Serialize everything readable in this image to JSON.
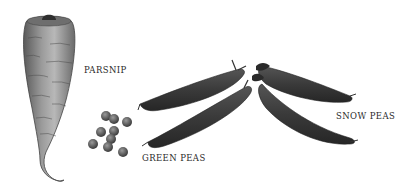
{
  "illustration": {
    "background": "#ffffff",
    "ink_color": "#3a3a3a",
    "labels": {
      "parsnip": "PARSNIP",
      "green_peas": "GREEN PEAS",
      "snow_peas": "SNOW PEAS"
    },
    "items": [
      {
        "name": "parsnip",
        "label": "PARSNIP"
      },
      {
        "name": "green-peas",
        "label": "GREEN PEAS",
        "loose_pea_count": 10,
        "pod_count": 2
      },
      {
        "name": "snow-peas",
        "label": "SNOW PEAS",
        "pod_count": 2
      }
    ]
  }
}
